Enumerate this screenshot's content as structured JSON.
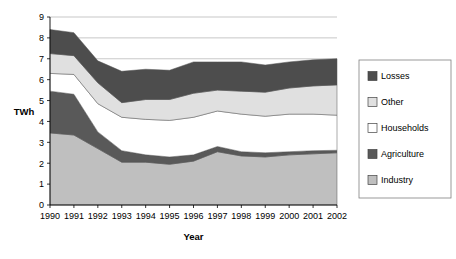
{
  "chart_data": {
    "type": "area",
    "stacked": true,
    "title": "",
    "xlabel": "Year",
    "ylabel": "TWh",
    "categories": [
      "1990",
      "1991",
      "1992",
      "1993",
      "1994",
      "1995",
      "1996",
      "1997",
      "1998",
      "1999",
      "2000",
      "2001",
      "2002"
    ],
    "ylim": [
      0,
      9
    ],
    "yticks": [
      0,
      1,
      2,
      3,
      4,
      5,
      6,
      7,
      8,
      9
    ],
    "grid": true,
    "legend_position": "right",
    "series": [
      {
        "name": "Industry",
        "color": "#bfbfbf",
        "values": [
          3.45,
          3.35,
          2.7,
          2.05,
          2.05,
          1.95,
          2.1,
          2.55,
          2.35,
          2.3,
          2.4,
          2.45,
          2.5
        ]
      },
      {
        "name": "Agriculture",
        "color": "#595959",
        "values": [
          2.0,
          1.95,
          0.8,
          0.55,
          0.35,
          0.35,
          0.3,
          0.25,
          0.2,
          0.2,
          0.15,
          0.15,
          0.12
        ]
      },
      {
        "name": "Households",
        "color": "#ffffff",
        "values": [
          0.85,
          0.95,
          1.35,
          1.6,
          1.7,
          1.75,
          1.8,
          1.7,
          1.8,
          1.75,
          1.8,
          1.75,
          1.68
        ]
      },
      {
        "name": "Other",
        "color": "#e0e0e0",
        "values": [
          0.95,
          0.9,
          1.0,
          0.7,
          0.95,
          1.0,
          1.15,
          1.0,
          1.1,
          1.15,
          1.25,
          1.35,
          1.45
        ]
      },
      {
        "name": "Losses",
        "color": "#4d4d4d",
        "values": [
          1.15,
          1.1,
          1.05,
          1.5,
          1.45,
          1.4,
          1.5,
          1.35,
          1.4,
          1.3,
          1.25,
          1.25,
          1.25
        ]
      }
    ],
    "stack_tops": {
      "Industry": [
        3.45,
        3.35,
        2.7,
        2.05,
        2.05,
        1.95,
        2.1,
        2.55,
        2.35,
        2.3,
        2.4,
        2.45,
        2.5
      ],
      "Agriculture": [
        5.45,
        5.3,
        3.5,
        2.6,
        2.4,
        2.3,
        2.4,
        2.8,
        2.55,
        2.5,
        2.55,
        2.6,
        2.62
      ],
      "Households": [
        6.3,
        6.25,
        4.85,
        4.2,
        4.1,
        4.05,
        4.2,
        4.5,
        4.35,
        4.25,
        4.35,
        4.35,
        4.3
      ],
      "Other": [
        7.25,
        7.15,
        5.85,
        4.9,
        5.05,
        5.05,
        5.35,
        5.5,
        5.45,
        5.4,
        5.6,
        5.7,
        5.75
      ],
      "Losses": [
        8.4,
        8.25,
        6.9,
        6.4,
        6.5,
        6.45,
        6.85,
        6.85,
        6.85,
        6.7,
        6.85,
        6.95,
        7.0
      ]
    }
  },
  "axes": {
    "ylabel": "TWh",
    "xlabel": "Year",
    "ytick_labels": [
      "9",
      "8",
      "7",
      "6",
      "5",
      "4",
      "3",
      "2",
      "1",
      "0"
    ],
    "xtick_labels": [
      "1990",
      "1991",
      "1992",
      "1993",
      "1994",
      "1995",
      "1996",
      "1997",
      "1998",
      "1999",
      "2000",
      "2001",
      "2002"
    ]
  },
  "legend": {
    "items": [
      {
        "label": "Losses",
        "swatch": "#4d4d4d"
      },
      {
        "label": "Other",
        "swatch": "#e0e0e0"
      },
      {
        "label": "Households",
        "swatch": "#ffffff"
      },
      {
        "label": "Agriculture",
        "swatch": "#595959"
      },
      {
        "label": "Industry",
        "swatch": "#bfbfbf"
      }
    ]
  }
}
